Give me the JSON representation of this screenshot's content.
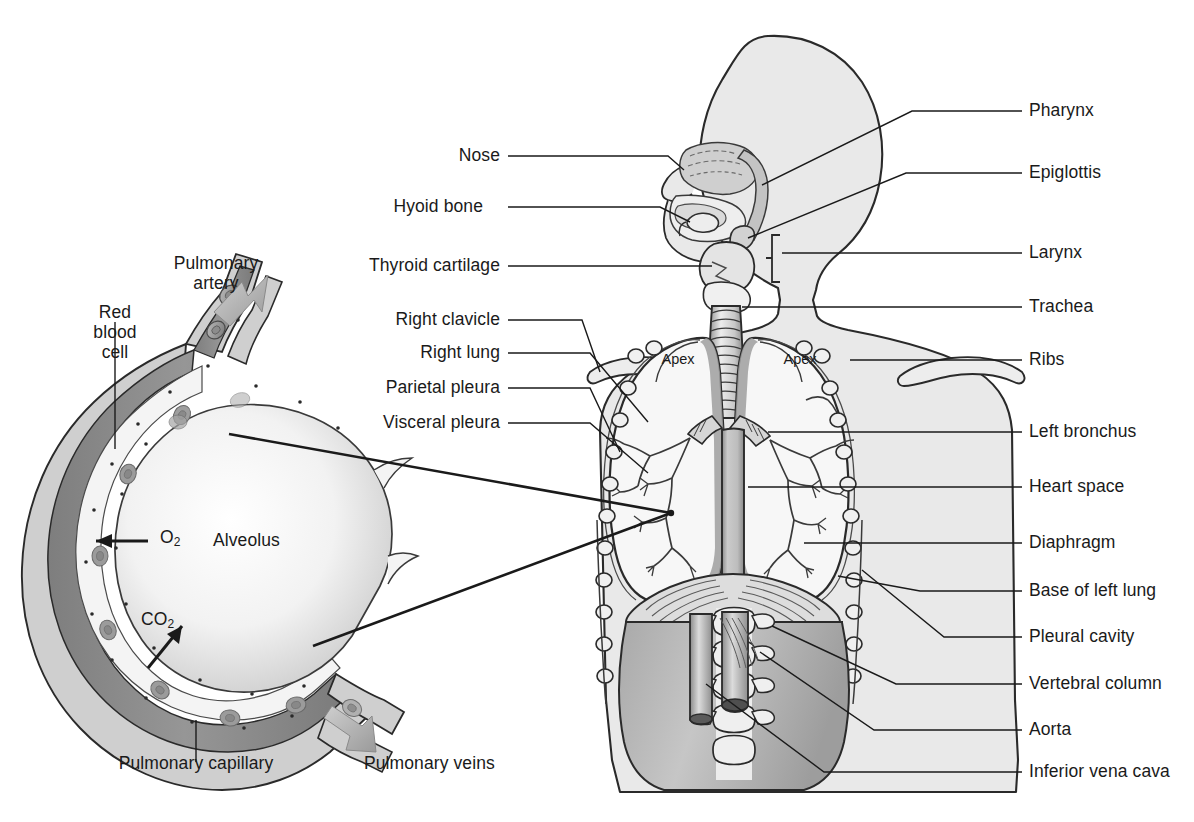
{
  "figure": {
    "kind": "anatomical-diagram",
    "colors": {
      "ink": "#1a1a1a",
      "body_fill": "#e9e9e9",
      "body_fill_dark": "#b9b9b9",
      "organ_fill": "#f6f6f6",
      "organ_shade": "#9a9a9a",
      "capillary_lumen": "#8c8c8c",
      "capillary_wall": "#d8d8d8",
      "alveolus_fill": "#fbfbfb",
      "arrow_gray": "#b0b0b0",
      "background": "#ffffff"
    }
  },
  "inset": {
    "title_labels": {
      "pulmonary_artery": "Pulmonary\nartery",
      "pulmonary_artery_line1": "Pulmonary",
      "pulmonary_artery_line2": "artery",
      "red_blood_cell_line1": "Red",
      "red_blood_cell_line2": "blood",
      "red_blood_cell_line3": "cell",
      "alveolus": "Alveolus",
      "o2": "O",
      "o2_sub": "2",
      "co2": "CO",
      "co2_sub": "2",
      "pulmonary_capillary": "Pulmonary capillary",
      "pulmonary_veins": "Pulmonary veins"
    }
  },
  "torso": {
    "apex_left_label": "Apex",
    "apex_right_label": "Apex"
  },
  "labels_left": [
    {
      "id": "nose",
      "text": "Nose",
      "x": 500,
      "y": 156
    },
    {
      "id": "hyoid-bone",
      "text": "Hyoid bone",
      "x": 483,
      "y": 207
    },
    {
      "id": "thyroid-cartilage",
      "text": "Thyroid cartilage",
      "x": 500,
      "y": 266
    },
    {
      "id": "right-clavicle",
      "text": "Right clavicle",
      "x": 500,
      "y": 320
    },
    {
      "id": "right-lung",
      "text": "Right lung",
      "x": 500,
      "y": 353
    },
    {
      "id": "parietal-pleura",
      "text": "Parietal pleura",
      "x": 500,
      "y": 388
    },
    {
      "id": "visceral-pleura",
      "text": "Visceral pleura",
      "x": 500,
      "y": 423
    }
  ],
  "labels_right": [
    {
      "id": "pharynx",
      "text": "Pharynx",
      "x": 1029,
      "y": 111
    },
    {
      "id": "epiglottis",
      "text": "Epiglottis",
      "x": 1029,
      "y": 173
    },
    {
      "id": "larynx",
      "text": "Larynx",
      "x": 1029,
      "y": 253
    },
    {
      "id": "trachea",
      "text": "Trachea",
      "x": 1029,
      "y": 307
    },
    {
      "id": "ribs",
      "text": "Ribs",
      "x": 1029,
      "y": 360
    },
    {
      "id": "left-bronchus",
      "text": "Left bronchus",
      "x": 1029,
      "y": 432
    },
    {
      "id": "heart-space",
      "text": "Heart space",
      "x": 1029,
      "y": 487
    },
    {
      "id": "diaphragm",
      "text": "Diaphragm",
      "x": 1029,
      "y": 543
    },
    {
      "id": "base-of-left-lung",
      "text": "Base of left lung",
      "x": 1029,
      "y": 591
    },
    {
      "id": "pleural-cavity",
      "text": "Pleural cavity",
      "x": 1029,
      "y": 637
    },
    {
      "id": "vertebral-column",
      "text": "Vertebral column",
      "x": 1029,
      "y": 684
    },
    {
      "id": "aorta",
      "text": "Aorta",
      "x": 1029,
      "y": 730
    },
    {
      "id": "inferior-vena-cava",
      "text": "Inferior vena cava",
      "x": 1029,
      "y": 772
    }
  ]
}
